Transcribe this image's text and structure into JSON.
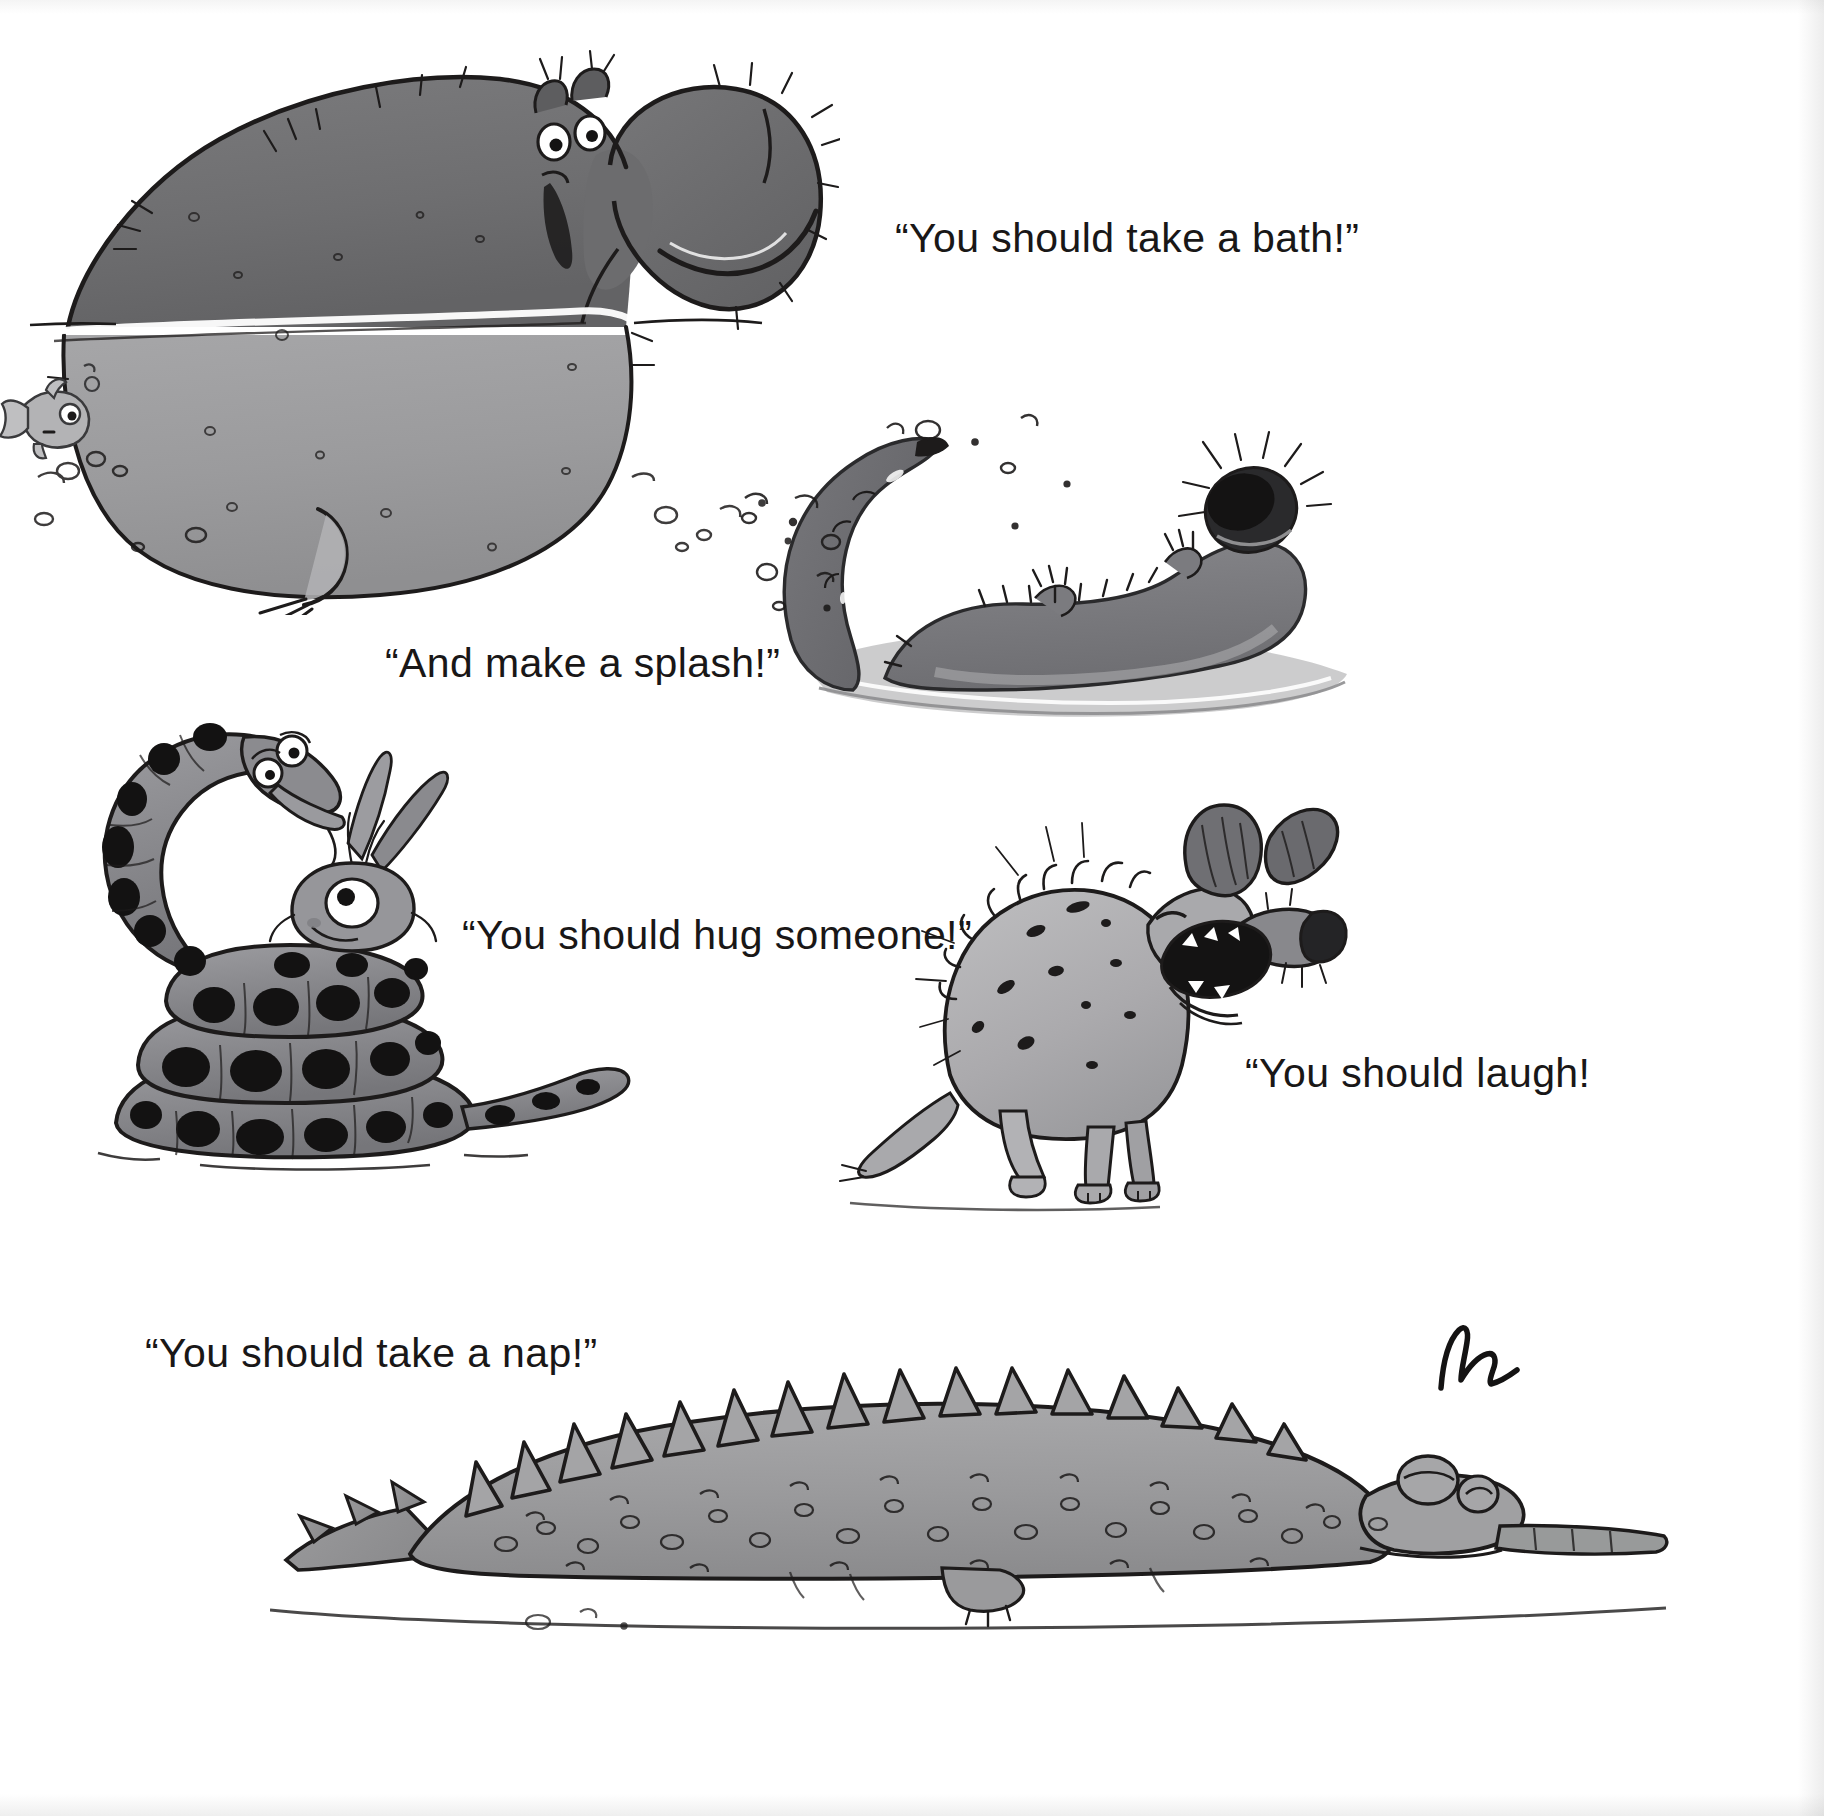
{
  "page": {
    "kind": "picture-book-spread",
    "background_color": "#ffffff",
    "ink_color": "#191717",
    "palette": {
      "ink": "#1d1b1b",
      "dark_grey": "#6f6f71",
      "mid_grey": "#8e8e90",
      "light_grey": "#aeaeb0",
      "pale_grey": "#c9c9cb",
      "shadow_grey": "#d6d6d8",
      "near_black": "#111010"
    }
  },
  "captions": [
    {
      "id": "caption-bath",
      "text": "“You should take a bath!”",
      "x": 895,
      "y": 215
    },
    {
      "id": "caption-splash",
      "text": "“And make a splash!”",
      "x": 385,
      "y": 640
    },
    {
      "id": "caption-hug",
      "text": "“You should hug someone!”",
      "x": 462,
      "y": 912
    },
    {
      "id": "caption-laugh",
      "text": "“You should laugh!",
      "x": 1245,
      "y": 1050
    },
    {
      "id": "caption-nap",
      "text": "“You should take a nap!”",
      "x": 145,
      "y": 1330
    }
  ],
  "illustrations": [
    {
      "id": "hippo",
      "name": "hippo-in-water",
      "description": "Large grey hippopotamus standing half-submerged, smiling, with bristly whiskers, wide-open eyes and a waterline across its body",
      "x": 20,
      "y": 35,
      "width": 800,
      "height": 560
    },
    {
      "id": "fish",
      "name": "small-fish",
      "description": "Tiny grey fish swimming at the left edge with bubbles",
      "x": 0,
      "y": 350,
      "width": 110,
      "height": 120
    },
    {
      "id": "otter",
      "name": "otter-splashing",
      "description": "Shaggy otter floating on its back in water, curling its tail up and splashing droplets",
      "x": 740,
      "y": 395,
      "width": 660,
      "height": 340
    },
    {
      "id": "snake-bug",
      "name": "snake-hugging-bug",
      "description": "Blotchy coiled snake rearing up and hugging a wide-eyed winged bug sitting inside its coils",
      "x": 80,
      "y": 720,
      "width": 540,
      "height": 460
    },
    {
      "id": "hyena",
      "name": "laughing-hyena",
      "description": "Spotted hyena sitting with its head thrown back, mouth wide open laughing, big ears and bristly mane",
      "x": 830,
      "y": 780,
      "width": 510,
      "height": 420
    },
    {
      "id": "crocodile",
      "name": "sleeping-crocodile",
      "description": "Long bumpy crocodile lying flat asleep with closed eyes and a spiky ridged back",
      "x": 280,
      "y": 1320,
      "width": 1360,
      "height": 300
    },
    {
      "id": "signature",
      "name": "artist-signature",
      "description": "Small hand-drawn ink signature scribble near the hyena's feet",
      "x": 1425,
      "y": 1315,
      "width": 120,
      "height": 90
    }
  ]
}
